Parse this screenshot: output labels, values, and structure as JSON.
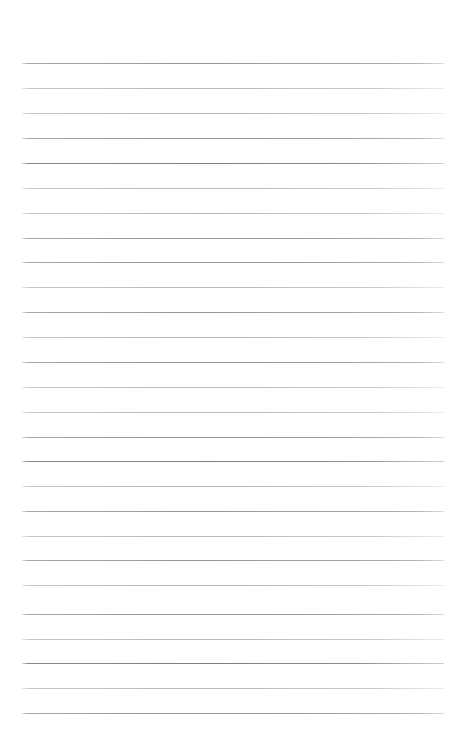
{
  "document": {
    "kind": "ruled-paper",
    "title": "Blank Ruled Notebook Page",
    "written_text": "",
    "page_width": 462,
    "page_height": 754,
    "background_color": "#ffffff",
    "rule_color": "#969696",
    "rule_color_dark": "#7e7e7e",
    "rule_color_light": "#a8a8a8",
    "rule_thickness_px": 1,
    "rule_left_px": 22,
    "rule_right_px": 444,
    "rule_width_px": 422,
    "first_rule_y_px": 63,
    "last_rule_y_px": 713,
    "rule_spacing_px": 25,
    "rule_count": 27,
    "top_margin_px": 63,
    "bottom_margin_px": 41,
    "has_vertical_margin_line": false,
    "has_header": false,
    "has_page_number": false
  },
  "rules": [
    {
      "index": 1,
      "y": 63,
      "weight": "normal"
    },
    {
      "index": 2,
      "y": 88,
      "weight": "lighter"
    },
    {
      "index": 3,
      "y": 113,
      "weight": "lighter"
    },
    {
      "index": 4,
      "y": 138,
      "weight": "normal"
    },
    {
      "index": 5,
      "y": 163,
      "weight": "darker"
    },
    {
      "index": 6,
      "y": 188,
      "weight": "lighter"
    },
    {
      "index": 7,
      "y": 213,
      "weight": "lighter"
    },
    {
      "index": 8,
      "y": 238,
      "weight": "normal"
    },
    {
      "index": 9,
      "y": 262,
      "weight": "normal"
    },
    {
      "index": 10,
      "y": 287,
      "weight": "lighter"
    },
    {
      "index": 11,
      "y": 312,
      "weight": "normal"
    },
    {
      "index": 12,
      "y": 337,
      "weight": "lighter"
    },
    {
      "index": 13,
      "y": 362,
      "weight": "normal"
    },
    {
      "index": 14,
      "y": 387,
      "weight": "lighter"
    },
    {
      "index": 15,
      "y": 412,
      "weight": "lighter"
    },
    {
      "index": 16,
      "y": 437,
      "weight": "normal"
    },
    {
      "index": 17,
      "y": 461,
      "weight": "darker"
    },
    {
      "index": 18,
      "y": 486,
      "weight": "lighter"
    },
    {
      "index": 19,
      "y": 511,
      "weight": "normal"
    },
    {
      "index": 20,
      "y": 536,
      "weight": "lighter"
    },
    {
      "index": 21,
      "y": 560,
      "weight": "normal"
    },
    {
      "index": 22,
      "y": 585,
      "weight": "lighter"
    },
    {
      "index": 23,
      "y": 614,
      "weight": "normal"
    },
    {
      "index": 24,
      "y": 639,
      "weight": "lighter"
    },
    {
      "index": 25,
      "y": 663,
      "weight": "darker"
    },
    {
      "index": 26,
      "y": 688,
      "weight": "lighter"
    },
    {
      "index": 27,
      "y": 713,
      "weight": "normal"
    }
  ]
}
